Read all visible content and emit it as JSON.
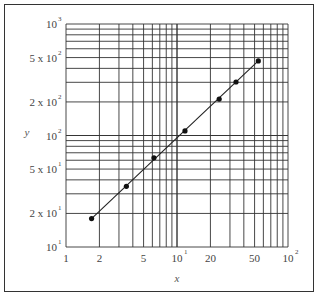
{
  "chart_data": {
    "type": "scatter",
    "title": "",
    "xlabel": "x",
    "ylabel": "y",
    "xscale": "log",
    "yscale": "log",
    "xlim": [
      1,
      100
    ],
    "ylim": [
      10,
      1000
    ],
    "grid": true,
    "x_tick_labels": [
      "1",
      "2",
      "5",
      "10^1",
      "20",
      "50",
      "10^2"
    ],
    "y_tick_labels": [
      "10^1",
      "2 x 10^1",
      "5 x 10^1",
      "10^2",
      "2 x 10^2",
      "5 x 10^2",
      "10^3"
    ],
    "series": [
      {
        "name": "data",
        "marker": "circle",
        "line": "straight fit",
        "x": [
          1.7,
          3.5,
          6.2,
          11.8,
          24,
          34,
          54
        ],
        "y": [
          18,
          35,
          63,
          110,
          212,
          302,
          466
        ]
      }
    ]
  },
  "labels": {
    "x_axis": "x",
    "y_axis": "y",
    "xticks": [
      {
        "base": "1",
        "sup": ""
      },
      {
        "base": "2",
        "sup": ""
      },
      {
        "base": "5",
        "sup": ""
      },
      {
        "base": "10",
        "sup": "1"
      },
      {
        "base": "20",
        "sup": ""
      },
      {
        "base": "50",
        "sup": ""
      },
      {
        "base": "10",
        "sup": "2"
      }
    ],
    "yticks": [
      {
        "base": "10",
        "sup": "1"
      },
      {
        "base": "2 x 10",
        "sup": "1"
      },
      {
        "base": "5 x 10",
        "sup": "1"
      },
      {
        "base": "10",
        "sup": "2"
      },
      {
        "base": "2 x 10",
        "sup": "2"
      },
      {
        "base": "5 x 10",
        "sup": "2"
      },
      {
        "base": "10",
        "sup": "3"
      }
    ]
  }
}
